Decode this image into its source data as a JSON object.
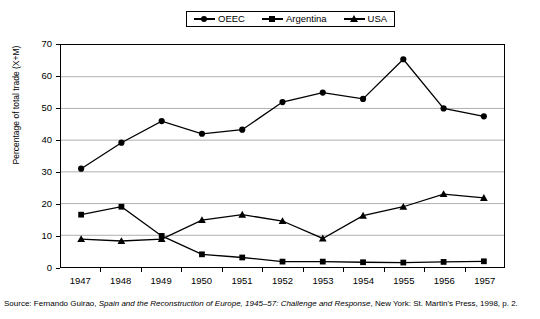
{
  "legend": {
    "position": "top-center",
    "items": [
      {
        "label": "OEEC",
        "marker": "circle-marker-icon"
      },
      {
        "label": "Argentina",
        "marker": "square-marker-icon"
      },
      {
        "label": "USA",
        "marker": "triangle-marker-icon"
      }
    ]
  },
  "axes": {
    "ylabel": "Percentage of total trade (X+M)",
    "yticks": [
      "0",
      "10",
      "20",
      "30",
      "40",
      "50",
      "60",
      "70"
    ],
    "xticks": [
      "1947",
      "1948",
      "1949",
      "1950",
      "1951",
      "1952",
      "1953",
      "1954",
      "1955",
      "1956",
      "1957"
    ]
  },
  "source": {
    "prefix": "Source: Fernando Guirao, ",
    "title": "Spain and the Reconstruction of Europe, 1945–57: Challenge and Response",
    "suffix": ", New York: St. Martin's Press, 1998, p. 2."
  },
  "colors": {
    "line": "#000000",
    "grid": "#9a9a9a",
    "frame": "#000000",
    "background": "#ffffff"
  },
  "chart_data": {
    "type": "line",
    "title": "",
    "xlabel": "",
    "ylabel": "Percentage of total trade (X+M)",
    "x": [
      "1947",
      "1948",
      "1949",
      "1950",
      "1951",
      "1952",
      "1953",
      "1954",
      "1955",
      "1956",
      "1957"
    ],
    "ylim": [
      0,
      70
    ],
    "xlim_categories": 11,
    "grid": "horizontal",
    "legend_position": "top-center",
    "series": [
      {
        "name": "OEEC",
        "marker": "circle",
        "values": [
          31,
          39.2,
          46,
          42,
          43.3,
          52,
          55,
          53,
          65.5,
          50,
          47.5
        ]
      },
      {
        "name": "Argentina",
        "marker": "square",
        "values": [
          16.5,
          19,
          9.8,
          4,
          3,
          1.7,
          1.7,
          1.5,
          1.4,
          1.6,
          1.8
        ]
      },
      {
        "name": "USA",
        "marker": "triangle",
        "values": [
          8.8,
          8.2,
          8.8,
          14.8,
          16.5,
          14.5,
          9,
          16.2,
          19,
          23,
          21.8
        ]
      }
    ]
  }
}
